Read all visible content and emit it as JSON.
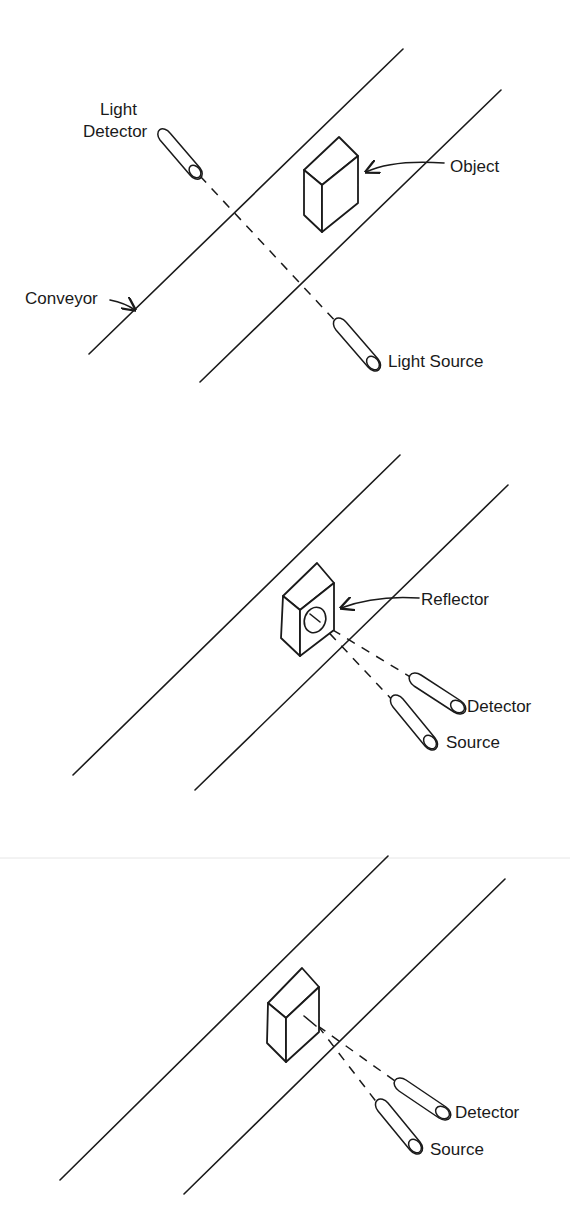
{
  "figure": {
    "panels": [
      {
        "id": "through-beam",
        "labels": {
          "detector_line1": "Light",
          "detector_line2": "Detector",
          "object": "Object",
          "conveyor": "Conveyor",
          "source": "Light Source"
        }
      },
      {
        "id": "retroreflective",
        "labels": {
          "reflector": "Reflector",
          "detector": "Detector",
          "source": "Source"
        }
      },
      {
        "id": "diffuse",
        "labels": {
          "detector": "Detector",
          "source": "Source"
        }
      }
    ]
  },
  "colors": {
    "ink": "#1a1a1a",
    "background": "#ffffff"
  }
}
